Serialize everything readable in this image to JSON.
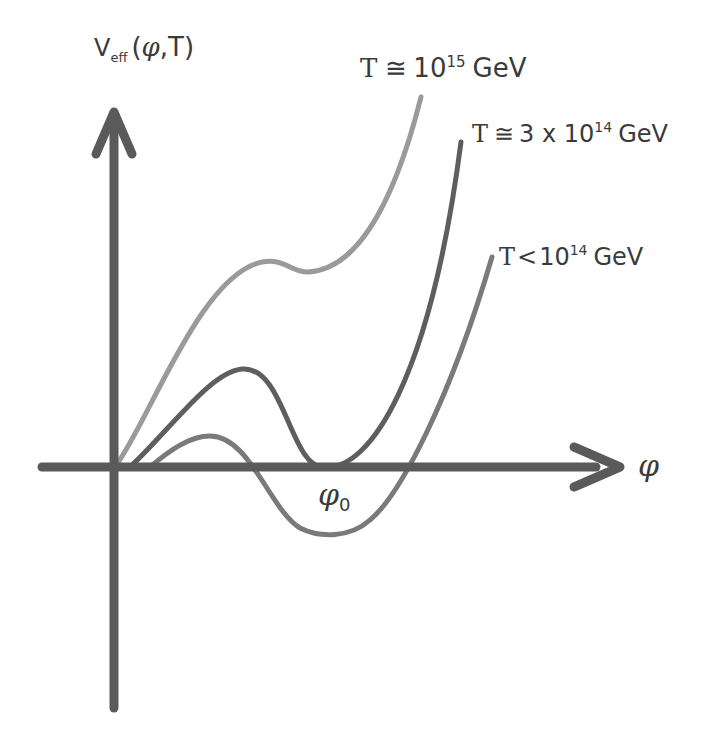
{
  "chart_data": {
    "type": "line",
    "title": "",
    "xlabel": "φ",
    "ylabel": "V_eff(φ,T)",
    "y_axis_label": {
      "main": "V",
      "sub": "eff",
      "args_prefix": "(",
      "phi": "φ",
      "args_suffix": ",T)"
    },
    "x_axis_label": "φ",
    "annotations": [
      {
        "text": "φ",
        "sub": "0",
        "meaning": "position of the minimum"
      }
    ],
    "grid": false,
    "legend_position": "inline labels at curve ends",
    "series": [
      {
        "name": "T ≅ 10^15 GeV",
        "label": {
          "T": "T",
          "rel": "≅",
          "base": "10",
          "exp": "15",
          "unit": "GeV",
          "prefix": ""
        },
        "color": "#9a9a9a",
        "description": "monotonic rise with a shoulder; no second minimum below zero",
        "path": "M115,467 C150,420 200,275 262,262 C285,258 290,272 308,272 C350,270 390,220 421,97"
      },
      {
        "name": "T ≅ 3 x 10^14 GeV",
        "label": {
          "T": "T",
          "rel": "≅",
          "base": "10",
          "exp": "14",
          "unit": "GeV",
          "prefix": "3 x "
        },
        "color": "#5e5e5e",
        "description": "local maximum then a degenerate minimum at φ0 (V≈0)",
        "path": "M130,467 C170,430 210,372 242,369 C285,365 290,470 325,467 C370,470 430,380 461,142"
      },
      {
        "name": "T < 10^14 GeV",
        "label": {
          "T": "T",
          "rel": "<",
          "base": "10",
          "exp": "14",
          "unit": "GeV",
          "prefix": ""
        },
        "color": "#7a7a7a",
        "description": "small barrier then a true minimum below zero near φ0",
        "path": "M150,467 C170,450 190,436 210,436 C250,436 270,510 300,528 C320,538 350,538 370,520 C400,495 450,400 492,257"
      }
    ],
    "axes": {
      "origin": [
        114,
        467
      ],
      "x_axis": {
        "from": 42,
        "to": 622,
        "color": "#5a5a5a"
      },
      "y_axis": {
        "from": 708,
        "to": 110,
        "color": "#5a5a5a"
      }
    }
  },
  "labels": {
    "y_axis": {
      "main": "V",
      "sub": "eff",
      "open": "(",
      "phi": "φ",
      "close": ",T)"
    },
    "x_axis": "φ",
    "phi0": {
      "main": "φ",
      "sub": "0"
    },
    "curve_top": {
      "T": "T",
      "rel": "≅",
      "base": "10",
      "exp": "15",
      "unit": "GeV"
    },
    "curve_mid": {
      "T": "T",
      "rel": "≅",
      "pre": "3 x 10",
      "exp": "14",
      "unit": "GeV"
    },
    "curve_low": {
      "T": "T",
      "rel": "<",
      "base": "10",
      "exp": "14",
      "unit": "GeV"
    }
  }
}
